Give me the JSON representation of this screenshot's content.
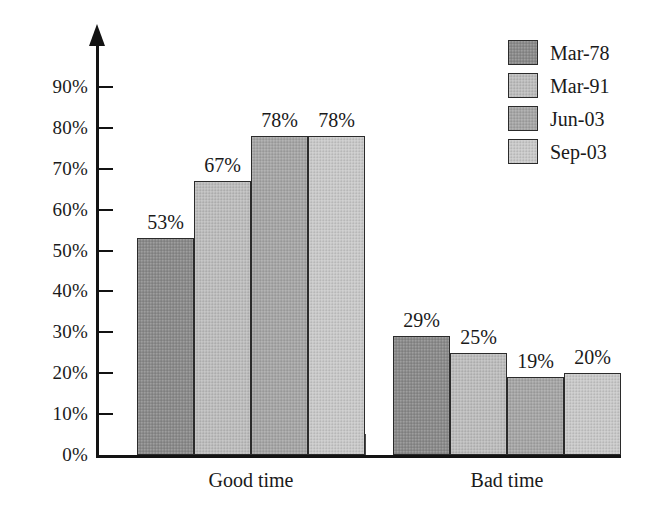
{
  "chart_data": {
    "type": "bar",
    "title": "",
    "subtitle": "",
    "xlabel": "",
    "ylabel": "",
    "categories": [
      "Good time",
      "Bad time"
    ],
    "series": [
      {
        "name": "Mar-78",
        "color": "#8b8b8b",
        "values": [
          53,
          29
        ]
      },
      {
        "name": "Mar-91",
        "color": "#bdbdbd",
        "values": [
          67,
          25
        ]
      },
      {
        "name": "Jun-03",
        "color": "#a6a6a6",
        "values": [
          78,
          19
        ]
      },
      {
        "name": "Sep-03",
        "color": "#c9c9c9",
        "values": [
          78,
          20
        ]
      }
    ],
    "value_labels": [
      [
        "53%",
        "67%",
        "78%",
        "78%"
      ],
      [
        "29%",
        "25%",
        "19%",
        "20%"
      ]
    ],
    "yticks": [
      0,
      10,
      20,
      30,
      40,
      50,
      60,
      70,
      80,
      90
    ],
    "ytick_labels": [
      "0%",
      "10%",
      "20%",
      "30%",
      "40%",
      "50%",
      "60%",
      "70%",
      "80%",
      "90%"
    ],
    "ylim": [
      0,
      90
    ],
    "grid": false,
    "legend_position": "top-right",
    "value_label_suffix": "%",
    "axis_color": "#131313",
    "bar_border_color": "#2b2b2b",
    "background_color": "#ffffff"
  },
  "legend": {
    "items": [
      {
        "label": "Mar-78",
        "color": "#8b8b8b"
      },
      {
        "label": "Mar-91",
        "color": "#bdbdbd"
      },
      {
        "label": "Jun-03",
        "color": "#a6a6a6"
      },
      {
        "label": "Sep-03",
        "color": "#c9c9c9"
      }
    ]
  },
  "axis": {
    "y_labels": [
      "90%",
      "80%",
      "70%",
      "60%",
      "50%",
      "40%",
      "30%",
      "20%",
      "10%",
      "0%"
    ],
    "x_labels": [
      "Good time",
      "Bad time"
    ]
  }
}
